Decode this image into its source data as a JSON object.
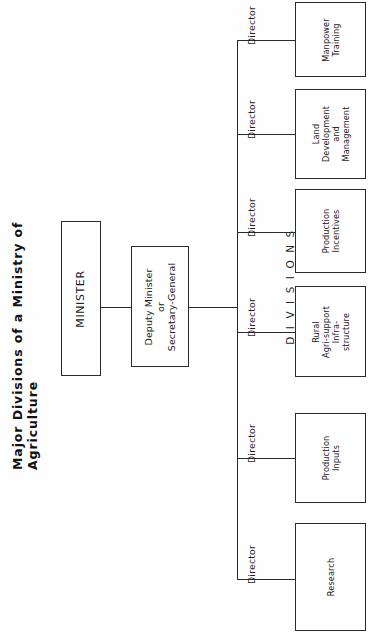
{
  "title": "Major Divisions of a Ministry of Agriculture",
  "divisions_caption": "DIVISIONS",
  "nodes": {
    "minister": "MINISTER",
    "deputy_line1": "Deputy Minister",
    "deputy_line2": "or",
    "deputy_line3": "Secretary-General"
  },
  "director_label": "Director",
  "directors": [
    {
      "label": "Director"
    },
    {
      "label": "Director"
    },
    {
      "label": "Director"
    },
    {
      "label": "Director"
    },
    {
      "label": "Director"
    },
    {
      "label": "Director"
    }
  ],
  "divisions": [
    {
      "name": "research",
      "lines": [
        "Research"
      ]
    },
    {
      "name": "production-inputs",
      "lines": [
        "Production",
        "Inputs"
      ]
    },
    {
      "name": "rural-agri-support-infrastructure",
      "lines": [
        "Rural",
        "Agri-support",
        "Infra-",
        "structure"
      ]
    },
    {
      "name": "production-incentives",
      "lines": [
        "Production",
        "Incentives"
      ]
    },
    {
      "name": "land-development-and-management",
      "lines": [
        "Land",
        "Development",
        "and",
        "Management"
      ]
    },
    {
      "name": "manpower-training",
      "lines": [
        "Manpower",
        "Training"
      ]
    }
  ],
  "colors": {
    "background": "#ffffff",
    "stroke": "#2b2b2b",
    "text": "#1a1a1a"
  }
}
